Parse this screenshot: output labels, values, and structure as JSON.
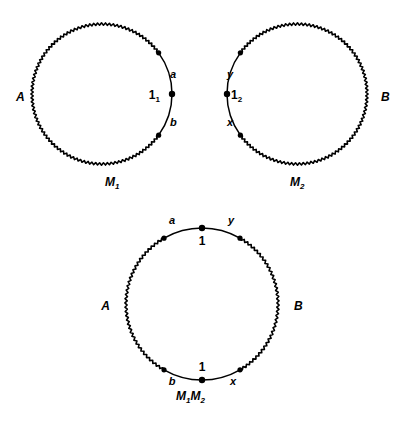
{
  "figure": {
    "title": "",
    "background_color": "#ffffff",
    "ink_color": "#000000",
    "circle_count": 3
  },
  "circles": [
    {
      "id": "M1",
      "caption": "M",
      "caption_sub": "1",
      "caption_x": 105,
      "caption_y": 186,
      "cx": 102,
      "cy": 94,
      "r": 70,
      "smooth_arc": {
        "start_deg": -36,
        "end_deg": 36
      },
      "endpoint_dots": [
        {
          "name": "arc-endpoint-upper",
          "deg": -36
        },
        {
          "name": "arc-endpoint-lower",
          "deg": 36
        }
      ],
      "marked_point": {
        "name": "identity-point",
        "deg": 0,
        "label": "1",
        "label_sub": "1",
        "label_x": 160,
        "label_y": 99,
        "anchor": "end"
      },
      "labels": [
        {
          "name": "label-A",
          "text": "A",
          "sub": "",
          "x": 16,
          "y": 101,
          "style": "lbl",
          "anchor": "start"
        },
        {
          "name": "label-a",
          "text": "a",
          "sub": "",
          "x": 170,
          "y": 78,
          "style": "lbl-sm",
          "anchor": "start"
        },
        {
          "name": "label-b",
          "text": "b",
          "sub": "",
          "x": 170,
          "y": 126,
          "style": "lbl-sm",
          "anchor": "start"
        }
      ]
    },
    {
      "id": "M2",
      "caption": "M",
      "caption_sub": "2",
      "caption_x": 290,
      "caption_y": 186,
      "cx": 297,
      "cy": 94,
      "r": 70,
      "smooth_arc": {
        "start_deg": 144,
        "end_deg": 216
      },
      "endpoint_dots": [
        {
          "name": "arc-endpoint-lower",
          "deg": 144
        },
        {
          "name": "arc-endpoint-upper",
          "deg": 216
        }
      ],
      "marked_point": {
        "name": "identity-point",
        "deg": 180,
        "label": "1",
        "label_sub": "2",
        "label_x": 231,
        "label_y": 99,
        "anchor": "start"
      },
      "labels": [
        {
          "name": "label-B",
          "text": "B",
          "sub": "",
          "x": 381,
          "y": 101,
          "style": "lbl",
          "anchor": "start"
        },
        {
          "name": "label-y",
          "text": "y",
          "sub": "",
          "x": 227,
          "y": 78,
          "style": "lbl-sm",
          "anchor": "start"
        },
        {
          "name": "label-x",
          "text": "x",
          "sub": "",
          "x": 227,
          "y": 126,
          "style": "lbl-sm",
          "anchor": "start"
        }
      ]
    },
    {
      "id": "M1M2",
      "caption": "M",
      "caption_sub": "1",
      "caption2": "M",
      "caption2_sub": "2",
      "caption_x": 176,
      "caption_y": 400,
      "cx": 202,
      "cy": 304,
      "r": 76,
      "smooth_arc": {
        "start_deg": -120,
        "end_deg": -60
      },
      "smooth_arc2": {
        "start_deg": 60,
        "end_deg": 120
      },
      "endpoint_dots": [
        {
          "name": "top-arc-endpoint-left",
          "deg": -120
        },
        {
          "name": "top-arc-endpoint-right",
          "deg": -60
        },
        {
          "name": "bottom-arc-endpoint-right",
          "deg": 60
        },
        {
          "name": "bottom-arc-endpoint-left",
          "deg": 120
        }
      ],
      "marked_points": [
        {
          "name": "identity-point-top",
          "deg": -90,
          "label": "1",
          "label_sub": "",
          "label_x": 202,
          "label_y": 245,
          "anchor": "middle"
        },
        {
          "name": "identity-point-bottom",
          "deg": 90,
          "label": "1",
          "label_sub": "",
          "label_x": 202,
          "label_y": 371,
          "anchor": "middle"
        }
      ],
      "labels": [
        {
          "name": "label-A",
          "text": "A",
          "sub": "",
          "x": 110,
          "y": 310,
          "style": "lbl",
          "anchor": "end"
        },
        {
          "name": "label-B",
          "text": "B",
          "sub": "",
          "x": 294,
          "y": 310,
          "style": "lbl",
          "anchor": "start"
        },
        {
          "name": "label-a",
          "text": "a",
          "sub": "",
          "x": 172,
          "y": 224,
          "style": "lbl-sm",
          "anchor": "middle"
        },
        {
          "name": "label-y",
          "text": "y",
          "sub": "",
          "x": 231,
          "y": 224,
          "style": "lbl-sm",
          "anchor": "middle"
        },
        {
          "name": "label-b",
          "text": "b",
          "sub": "",
          "x": 172,
          "y": 385,
          "style": "lbl-sm",
          "anchor": "middle"
        },
        {
          "name": "label-x",
          "text": "x",
          "sub": "",
          "x": 233,
          "y": 385,
          "style": "lbl-sm",
          "anchor": "middle"
        }
      ]
    }
  ],
  "legend_text": {
    "identity_symbol": "1",
    "generator_labels": [
      "a",
      "b",
      "x",
      "y"
    ],
    "boundary_labels": [
      "A",
      "B"
    ]
  }
}
